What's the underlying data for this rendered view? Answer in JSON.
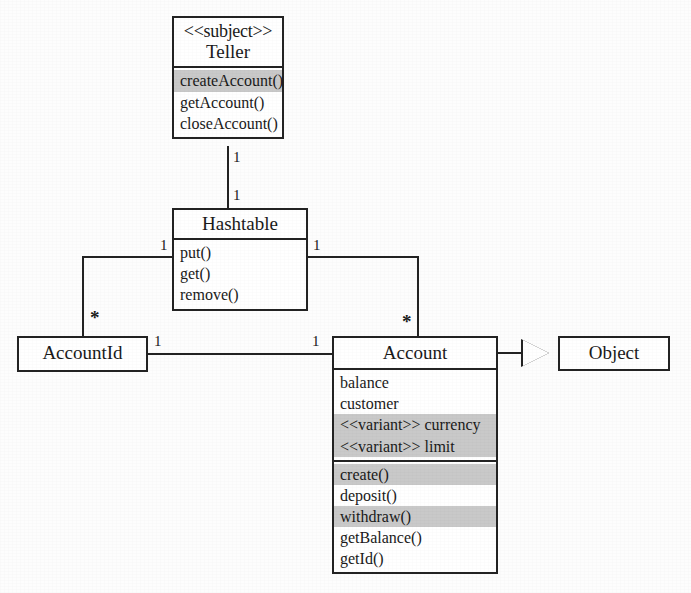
{
  "diagram": {
    "type": "uml-class-diagram",
    "classes": [
      {
        "id": "teller",
        "stereotype": "<<subject>>",
        "name": "Teller",
        "attributes": [],
        "operations": [
          {
            "text": "createAccount()",
            "shaded": true
          },
          {
            "text": "getAccount()",
            "shaded": false
          },
          {
            "text": "closeAccount()",
            "shaded": false
          }
        ]
      },
      {
        "id": "hashtable",
        "stereotype": "",
        "name": "Hashtable",
        "attributes": [],
        "operations": [
          {
            "text": "put()",
            "shaded": false
          },
          {
            "text": "get()",
            "shaded": false
          },
          {
            "text": "remove()",
            "shaded": false
          }
        ]
      },
      {
        "id": "accountid",
        "stereotype": "",
        "name": "AccountId",
        "attributes": [],
        "operations": []
      },
      {
        "id": "account",
        "stereotype": "",
        "name": "Account",
        "attributes": [
          {
            "text": "balance",
            "shaded": false
          },
          {
            "text": "customer",
            "shaded": false
          },
          {
            "text": "<<variant>> currency",
            "shaded": true
          },
          {
            "text": "<<variant>> limit",
            "shaded": true
          }
        ],
        "operations": [
          {
            "text": "create()",
            "shaded": true
          },
          {
            "text": "deposit()",
            "shaded": false
          },
          {
            "text": "withdraw()",
            "shaded": true
          },
          {
            "text": "getBalance()",
            "shaded": false
          },
          {
            "text": "getId()",
            "shaded": false
          }
        ]
      },
      {
        "id": "object",
        "stereotype": "",
        "name": "Object",
        "attributes": [],
        "operations": []
      }
    ],
    "multiplicities": {
      "teller_to_hashtable_source": "1",
      "teller_to_hashtable_target": "1",
      "hashtable_left": "1",
      "hashtable_right": "1",
      "accountid_top": "*",
      "accountid_right": "1",
      "account_left": "1",
      "account_top": "*"
    },
    "relations": [
      {
        "name": "teller-hashtable",
        "kind": "association",
        "from": "Teller",
        "to": "Hashtable",
        "from_mult": "1",
        "to_mult": "1"
      },
      {
        "name": "hashtable-accountid",
        "kind": "association",
        "from": "Hashtable",
        "to": "AccountId",
        "from_mult": "1",
        "to_mult": "*"
      },
      {
        "name": "hashtable-account",
        "kind": "association",
        "from": "Hashtable",
        "to": "Account",
        "from_mult": "1",
        "to_mult": "*"
      },
      {
        "name": "accountid-account",
        "kind": "association",
        "from": "AccountId",
        "to": "Account",
        "from_mult": "1",
        "to_mult": "1"
      },
      {
        "name": "account-object",
        "kind": "generalization",
        "from": "Account",
        "to": "Object",
        "from_mult": "",
        "to_mult": ""
      }
    ],
    "colors": {
      "stroke": "#232323",
      "fill": "#ffffff",
      "highlight": "#c9c9c9",
      "background": "#fdfdfd"
    }
  }
}
